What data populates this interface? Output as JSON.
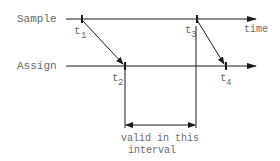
{
  "diagram": {
    "rows": [
      {
        "name": "sample",
        "label": "Sample"
      },
      {
        "name": "assign",
        "label": "Assign"
      }
    ],
    "axis_label": "time",
    "ticks": [
      {
        "name": "t1",
        "base": "t",
        "sub": "1",
        "row": "sample"
      },
      {
        "name": "t2",
        "base": "t",
        "sub": "2",
        "row": "assign"
      },
      {
        "name": "t3",
        "base": "t",
        "sub": "3",
        "row": "sample"
      },
      {
        "name": "t4",
        "base": "t",
        "sub": "4",
        "row": "assign"
      }
    ],
    "interval_label_line1": "valid in this",
    "interval_label_line2": "interval",
    "colors": {
      "line": "#1a1a1a",
      "text": "#6a6a6a"
    }
  }
}
